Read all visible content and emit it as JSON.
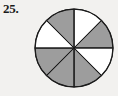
{
  "figure": {
    "number_label": "25.",
    "kind": "fraction-circle",
    "background_color": "#f2f1ef",
    "outline_color": "#1b1b1b",
    "shaded_color": "#9d9d9d",
    "unshaded_color": "#ffffff"
  },
  "chart_data": {
    "type": "pie",
    "title": "25.",
    "xlabel": "",
    "ylabel": "",
    "total_slices": 8,
    "slice_angle_degrees": 45,
    "shaded_count": 5,
    "unshaded_count": 3,
    "fraction_shaded": "5/8",
    "legend_position": "none",
    "grid": false,
    "categories": [
      "12:00-1:30",
      "1:30-3:00",
      "3:00-4:30",
      "4:30-6:00",
      "6:00-7:30",
      "7:30-9:00",
      "9:00-10:30",
      "10:30-12:00"
    ],
    "values": [
      45,
      45,
      45,
      45,
      45,
      45,
      45,
      45
    ],
    "slices": [
      {
        "index": 0,
        "start_deg": 0,
        "end_deg": 45,
        "shaded": false,
        "color": "#ffffff"
      },
      {
        "index": 1,
        "start_deg": 45,
        "end_deg": 90,
        "shaded": true,
        "color": "#9d9d9d"
      },
      {
        "index": 2,
        "start_deg": 90,
        "end_deg": 135,
        "shaded": false,
        "color": "#ffffff"
      },
      {
        "index": 3,
        "start_deg": 135,
        "end_deg": 180,
        "shaded": true,
        "color": "#9d9d9d"
      },
      {
        "index": 4,
        "start_deg": 180,
        "end_deg": 225,
        "shaded": true,
        "color": "#9d9d9d"
      },
      {
        "index": 5,
        "start_deg": 225,
        "end_deg": 270,
        "shaded": true,
        "color": "#9d9d9d"
      },
      {
        "index": 6,
        "start_deg": 270,
        "end_deg": 315,
        "shaded": false,
        "color": "#ffffff"
      },
      {
        "index": 7,
        "start_deg": 315,
        "end_deg": 360,
        "shaded": true,
        "color": "#9d9d9d"
      }
    ]
  }
}
